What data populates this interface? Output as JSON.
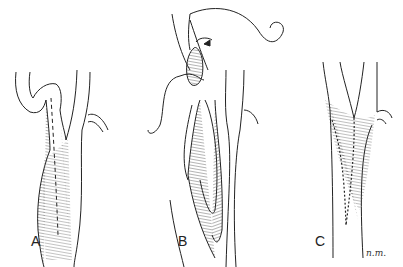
{
  "figure": {
    "panels": [
      {
        "label": "A",
        "description": "Carotid bifurcation with dashed arteriotomy line"
      },
      {
        "label": "B",
        "description": "Opened artery with plaque elevated and suture needles"
      },
      {
        "label": "C",
        "description": "Closed arteriotomy with running suture"
      }
    ],
    "signature": "n.m.",
    "colors": {
      "ink": "#222222",
      "background": "#ffffff"
    }
  }
}
